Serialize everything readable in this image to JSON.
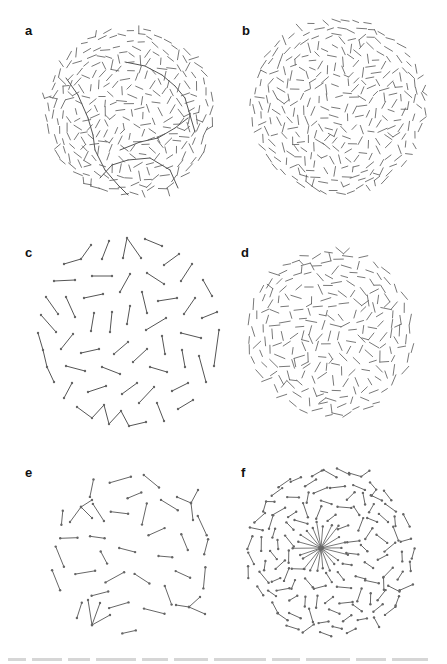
{
  "figure": {
    "background": "#ffffff",
    "stroke_color": "#555555",
    "node_color": "#666666",
    "panels": [
      {
        "id": "a",
        "label": "a",
        "label_pos": [
          25,
          24
        ],
        "center": [
          130,
          112
        ],
        "radius": 88,
        "style": "dense-short",
        "count": 620,
        "seg_len": 8,
        "nodes": false,
        "seed": 11,
        "chains": [
          [
            [
              66,
              78
            ],
            [
              78,
              95
            ],
            [
              88,
              118
            ],
            [
              93,
              135
            ],
            [
              95,
              150
            ],
            [
              105,
              170
            ],
            [
              118,
              185
            ],
            [
              128,
              195
            ]
          ],
          [
            [
              125,
              62
            ],
            [
              145,
              66
            ],
            [
              162,
              75
            ],
            [
              175,
              86
            ],
            [
              185,
              98
            ],
            [
              190,
              115
            ],
            [
              195,
              132
            ]
          ],
          [
            [
              120,
              150
            ],
            [
              140,
              142
            ],
            [
              158,
              138
            ],
            [
              175,
              128
            ],
            [
              188,
              118
            ]
          ],
          [
            [
              100,
              178
            ],
            [
              112,
              165
            ],
            [
              128,
              160
            ],
            [
              150,
              158
            ],
            [
              170,
              170
            ],
            [
              178,
              188
            ]
          ]
        ]
      },
      {
        "id": "b",
        "label": "b",
        "label_pos": [
          242,
          24
        ],
        "center": [
          338,
          106
        ],
        "radius": 92,
        "style": "dense-short",
        "count": 720,
        "seg_len": 8,
        "nodes": false,
        "seed": 23,
        "chains": []
      },
      {
        "id": "c",
        "label": "c",
        "label_pos": [
          25,
          246
        ],
        "center": [
          130,
          333
        ],
        "radius": 90,
        "style": "explicit",
        "nodes": true,
        "polylines": [
          [
            [
              64,
              264
            ],
            [
              81,
              259
            ],
            [
              91,
              245
            ]
          ],
          [
            [
              102,
              259
            ],
            [
              109,
              241
            ]
          ],
          [
            [
              123,
              258
            ],
            [
              127,
              238
            ],
            [
              141,
              258
            ]
          ],
          [
            [
              145,
              239
            ],
            [
              162,
              246
            ]
          ],
          [
            [
              164,
              265
            ],
            [
              179,
              254
            ]
          ],
          [
            [
              181,
              281
            ],
            [
              192,
              264
            ]
          ],
          [
            [
              203,
              280
            ],
            [
              212,
              296
            ]
          ],
          [
            [
              54,
              281
            ],
            [
              75,
              280
            ]
          ],
          [
            [
              92,
              276
            ],
            [
              112,
              276
            ]
          ],
          [
            [
              120,
              292
            ],
            [
              130,
              274
            ]
          ],
          [
            [
              147,
              273
            ],
            [
              164,
              284
            ]
          ],
          [
            [
              84,
              298
            ],
            [
              103,
              294
            ]
          ],
          [
            [
              142,
              292
            ],
            [
              147,
              313
            ]
          ],
          [
            [
              158,
              301
            ],
            [
              177,
              298
            ]
          ],
          [
            [
              184,
              314
            ],
            [
              195,
              298
            ]
          ],
          [
            [
              202,
              318
            ],
            [
              217,
              312
            ]
          ],
          [
            [
              46,
              297
            ],
            [
              58,
              314
            ]
          ],
          [
            [
              66,
              297
            ],
            [
              75,
              317
            ]
          ],
          [
            [
              41,
              315
            ],
            [
              56,
              332
            ]
          ],
          [
            [
              91,
              331
            ],
            [
              94,
              313
            ]
          ],
          [
            [
              110,
              332
            ],
            [
              112,
              312
            ]
          ],
          [
            [
              127,
              324
            ],
            [
              130,
              306
            ]
          ],
          [
            [
              146,
              330
            ],
            [
              166,
              318
            ]
          ],
          [
            [
              38,
              333
            ],
            [
              43,
              350
            ],
            [
              47,
              367
            ],
            [
              54,
              382
            ]
          ],
          [
            [
              61,
              349
            ],
            [
              73,
              334
            ]
          ],
          [
            [
              81,
              353
            ],
            [
              99,
              349
            ]
          ],
          [
            [
              114,
              354
            ],
            [
              128,
              342
            ]
          ],
          [
            [
              133,
              362
            ],
            [
              147,
              349
            ]
          ],
          [
            [
              162,
              336
            ],
            [
              165,
              354
            ]
          ],
          [
            [
              181,
              333
            ],
            [
              201,
              338
            ]
          ],
          [
            [
              182,
              350
            ],
            [
              185,
              367
            ]
          ],
          [
            [
              199,
              356
            ],
            [
              206,
              382
            ]
          ],
          [
            [
              219,
              330
            ],
            [
              214,
              366
            ]
          ],
          [
            [
              66,
              366
            ],
            [
              85,
              371
            ]
          ],
          [
            [
              102,
              367
            ],
            [
              120,
              374
            ]
          ],
          [
            [
              150,
              367
            ],
            [
              167,
              372
            ]
          ],
          [
            [
              64,
              398
            ],
            [
              72,
              383
            ]
          ],
          [
            [
              88,
              392
            ],
            [
              106,
              386
            ]
          ],
          [
            [
              122,
              394
            ],
            [
              137,
              383
            ]
          ],
          [
            [
              139,
              403
            ],
            [
              154,
              387
            ]
          ],
          [
            [
              172,
              391
            ],
            [
              188,
              383
            ]
          ],
          [
            [
              178,
              409
            ],
            [
              193,
              400
            ]
          ],
          [
            [
              77,
              407
            ],
            [
              92,
              418
            ],
            [
              104,
              405
            ],
            [
              109,
              424
            ],
            [
              121,
              411
            ],
            [
              129,
              426
            ],
            [
              146,
              422
            ]
          ],
          [
            [
              157,
              403
            ],
            [
              164,
              421
            ]
          ]
        ]
      },
      {
        "id": "d",
        "label": "d",
        "label_pos": [
          241,
          246
        ],
        "center": [
          331,
          333
        ],
        "radius": 88,
        "style": "dense-short",
        "count": 430,
        "seg_len": 9,
        "nodes": false,
        "seed": 37,
        "chains": []
      },
      {
        "id": "e",
        "label": "e",
        "label_pos": [
          25,
          466
        ],
        "center": [
          130,
          553
        ],
        "radius": 88,
        "style": "sparse-medium",
        "count": 105,
        "seg_len": 18,
        "nodes": true,
        "seed": 41,
        "hubs": [
          {
            "center": [
              92,
              625
            ],
            "spokes": [
              [
                88,
                600
              ],
              [
                100,
                603
              ],
              [
                110,
                615
              ]
            ]
          },
          {
            "center": [
              191,
              503
            ],
            "spokes": [
              [
                177,
                497
              ],
              [
                198,
                490
              ],
              [
                193,
                520
              ]
            ]
          },
          {
            "center": [
              189,
              607
            ],
            "spokes": [
              [
                176,
                605
              ],
              [
                205,
                614
              ],
              [
                200,
                597
              ]
            ]
          },
          {
            "center": [
              81,
              507
            ],
            "spokes": [
              [
                70,
                522
              ],
              [
                92,
                500
              ],
              [
                92,
                518
              ]
            ]
          }
        ]
      },
      {
        "id": "f",
        "label": "f",
        "label_pos": [
          241,
          466
        ],
        "center": [
          330,
          553
        ],
        "radius": 90,
        "style": "medium",
        "count": 230,
        "seg_len": 12,
        "nodes": true,
        "seed": 53,
        "star": {
          "center": [
            321,
            548
          ],
          "rays": 22,
          "length": 26
        }
      }
    ]
  }
}
